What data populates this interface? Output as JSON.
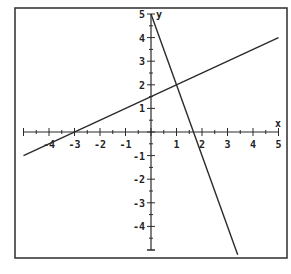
{
  "chart_data": {
    "type": "line",
    "title": "",
    "xlabel": "x",
    "ylabel": "y",
    "xlim": [
      -5,
      5
    ],
    "ylim": [
      -5,
      5
    ],
    "grid": false,
    "x_ticks": [
      -4,
      -3,
      -2,
      -1,
      1,
      2,
      3,
      4,
      5
    ],
    "x_tick_labels": [
      "-4",
      "-3",
      "-2",
      "-1",
      "1",
      "2",
      "3",
      "4",
      "5"
    ],
    "y_ticks": [
      5,
      4,
      3,
      2,
      1,
      -1,
      -2,
      -3,
      -4
    ],
    "y_tick_labels": [
      "5",
      "4",
      "3",
      "2",
      "1",
      "-1",
      "-2",
      "-3",
      "-4"
    ],
    "minor_ticks_per_unit": 2,
    "series": [
      {
        "name": "line-1",
        "equation": "y = 0.5x + 1.5",
        "x": [
          -5,
          5
        ],
        "y": [
          -1,
          4
        ],
        "x_intercept": -3,
        "y_intercept": 1.5
      },
      {
        "name": "line-2",
        "equation": "y = -3x + 5",
        "x": [
          0,
          3.4
        ],
        "y": [
          5,
          -5.2
        ],
        "x_intercept": 1.67,
        "y_intercept": 5
      }
    ],
    "intersection": {
      "x": 1,
      "y": 2
    }
  },
  "labels": {
    "x_axis": "x",
    "y_axis": "y"
  },
  "layout": {
    "frame": {
      "left": 15,
      "top": 8,
      "right": 287,
      "bottom": 258
    },
    "origin_px": {
      "x": 151,
      "y": 132
    },
    "unit_px_x": 25.5,
    "unit_px_y": 23.6,
    "stroke_color": "#2a2a2a",
    "background": "#ffffff"
  }
}
